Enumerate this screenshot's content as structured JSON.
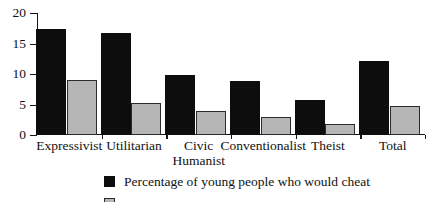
{
  "chart_data": {
    "type": "bar",
    "title": "",
    "subtitle": "",
    "xlabel": "",
    "ylabel": "",
    "ylim": [
      0,
      20
    ],
    "yticks": [
      0,
      5,
      10,
      15,
      20
    ],
    "grid": false,
    "legend_position": "bottom",
    "categories": [
      "Expressivist",
      "Utilitarian",
      "Civic\nHumanist",
      "Conventionalist",
      "Theist",
      "Total"
    ],
    "series": [
      {
        "name": "Percentage of young people who would cheat",
        "color": "#0d0d0d",
        "values": [
          17.4,
          16.7,
          9.9,
          8.8,
          5.8,
          12.2
        ]
      },
      {
        "name": "",
        "color": "#b6b6b6",
        "values": [
          9.0,
          5.2,
          3.9,
          2.9,
          1.8,
          4.7
        ]
      }
    ]
  },
  "legend": {
    "entries": [
      {
        "label": "Percentage of young people who would cheat",
        "swatch": "dark"
      },
      {
        "label": "",
        "swatch": "light"
      }
    ]
  }
}
